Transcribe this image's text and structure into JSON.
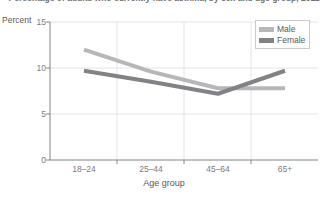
{
  "chart_data": {
    "type": "line",
    "title": "Percentage of adults who currently have asthma, by sex and age group, 2011",
    "xlabel": "Age group",
    "ylabel": "Percent",
    "categories": [
      "18–24",
      "25–44",
      "45–64",
      "65+"
    ],
    "ylim": [
      0,
      15
    ],
    "yticks": [
      0,
      5,
      10,
      15
    ],
    "grid": true,
    "legend_position": "top-right",
    "series": [
      {
        "name": "Male",
        "values": [
          12.0,
          9.6,
          7.8,
          7.8
        ],
        "color": "#b6b7b9"
      },
      {
        "name": "Female",
        "values": [
          9.7,
          8.5,
          7.2,
          9.7
        ],
        "color": "#808285"
      }
    ]
  },
  "axes": {
    "y_title": "Percent",
    "x_title": "Age group",
    "y_tick_labels": [
      "15",
      "10",
      "5",
      "0"
    ],
    "x_tick_labels": [
      "18–24",
      "25–44",
      "45–64",
      "65+"
    ]
  },
  "legend": {
    "items": [
      {
        "label": "Male"
      },
      {
        "label": "Female"
      }
    ]
  },
  "colors": {
    "male": "#b6b7b9",
    "female": "#808285",
    "axis": "#808285",
    "grid": "#e3e4e6",
    "text": "#58595b"
  }
}
